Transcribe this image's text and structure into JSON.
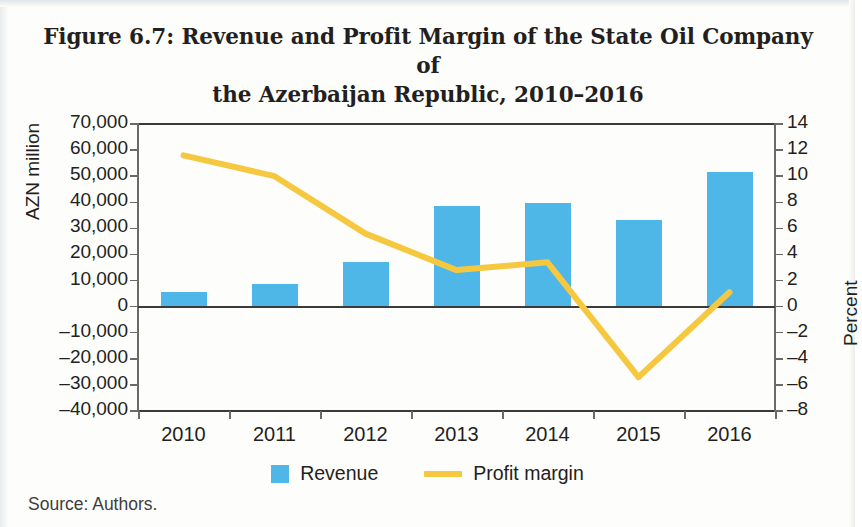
{
  "figure": {
    "title_line1": "Figure 6.7: Revenue and Profit Margin of the State Oil Company of",
    "title_line2": "the Azerbaijan Republic, 2010–2016",
    "source": "Source: Authors."
  },
  "legend": {
    "position": "bottom-center",
    "items": [
      {
        "label": "Revenue",
        "marker": "square-swatch",
        "color": "#4fb6e8"
      },
      {
        "label": "Profit margin",
        "marker": "line-swatch",
        "color": "#f6c83f"
      }
    ]
  },
  "colors": {
    "bar": "#4fb6e8",
    "line": "#f6c83f",
    "axis": "#3a3a3a",
    "text": "#231f20",
    "page": "#fdfdfb"
  },
  "chart_data": {
    "type": "bar",
    "title": "Figure 6.7: Revenue and Profit Margin of the State Oil Company of the Azerbaijan Republic, 2010–2016",
    "xlabel": "",
    "categories": [
      "2010",
      "2011",
      "2012",
      "2013",
      "2014",
      "2015",
      "2016"
    ],
    "grid": false,
    "legend_position": "bottom-center",
    "series": [
      {
        "name": "Revenue",
        "type": "bar",
        "axis": "left",
        "unit": "AZN million",
        "color": "#4fb6e8",
        "values": [
          5700,
          8800,
          17200,
          38700,
          39900,
          33300,
          51700
        ]
      },
      {
        "name": "Profit margin",
        "type": "line",
        "axis": "right",
        "unit": "Percent",
        "color": "#f6c83f",
        "values": [
          11.6,
          10.0,
          5.6,
          2.8,
          3.4,
          -5.4,
          1.1
        ]
      }
    ],
    "axes": {
      "left": {
        "label": "AZN million",
        "ylim": [
          -40000,
          70000
        ],
        "tick_step": 10000,
        "ticks": [
          70000,
          60000,
          50000,
          40000,
          30000,
          20000,
          10000,
          0,
          -10000,
          -20000,
          -30000,
          -40000
        ],
        "tick_labels": [
          "70,000",
          "60,000",
          "50,000",
          "40,000",
          "30,000",
          "20,000",
          "10,000",
          "0",
          "–10,000",
          "–20,000",
          "–30,000",
          "–40,000"
        ]
      },
      "right": {
        "label": "Percent",
        "ylim": [
          -8,
          14
        ],
        "tick_step": 2,
        "ticks": [
          14,
          12,
          10,
          8,
          6,
          4,
          2,
          0,
          -2,
          -4,
          -6,
          -8
        ],
        "tick_labels": [
          "14",
          "12",
          "10",
          "8",
          "6",
          "4",
          "2",
          "0",
          "–2",
          "–4",
          "–6",
          "–8"
        ]
      }
    }
  }
}
